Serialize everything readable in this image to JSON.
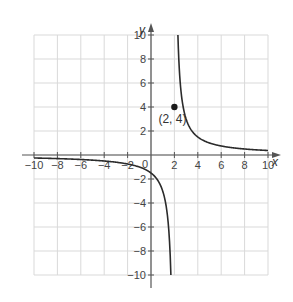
{
  "chart_data": {
    "type": "line",
    "title": "",
    "xlabel": "x",
    "ylabel": "y",
    "xlim": [
      -10,
      10
    ],
    "ylim": [
      -10,
      10
    ],
    "grid": true,
    "x_ticks": [
      -10,
      -8,
      -6,
      -4,
      -2,
      2,
      4,
      6,
      8,
      10
    ],
    "y_ticks": [
      -10,
      -8,
      -6,
      -4,
      -2,
      2,
      4,
      6,
      8,
      10
    ],
    "origin_label": "0",
    "function": "f(x) = 3/(x - 2)",
    "vertical_asymptote": 2,
    "horizontal_asymptote": 0,
    "series": [
      {
        "name": "left-branch",
        "x": [
          -10,
          -8,
          -6,
          -4,
          -2,
          -1,
          0,
          0.5,
          1,
          1.3,
          1.5,
          1.6,
          1.7
        ],
        "y": [
          -0.25,
          -0.3,
          -0.375,
          -0.5,
          -0.75,
          -1,
          -1.5,
          -2,
          -3,
          -4.29,
          -6,
          -7.5,
          -10
        ]
      },
      {
        "name": "right-branch",
        "x": [
          2.3,
          2.4,
          2.5,
          2.75,
          3,
          3.5,
          4,
          5,
          6,
          8,
          10
        ],
        "y": [
          10,
          7.5,
          6,
          4,
          3,
          2,
          1.5,
          1,
          0.75,
          0.5,
          0.375
        ]
      }
    ],
    "annotations": [
      {
        "type": "point",
        "x": 2,
        "y": 4,
        "label": "(2, 4)"
      }
    ]
  },
  "labels": {
    "x_axis": "x",
    "y_axis": "y",
    "origin": "0",
    "point": "(2, 4)",
    "xticks": [
      "−10",
      "−8",
      "−6",
      "−4",
      "−2",
      "2",
      "4",
      "6",
      "8",
      "10"
    ],
    "yticks": [
      "10",
      "8",
      "6",
      "4",
      "2",
      "−2",
      "−4",
      "−6",
      "−8",
      "−10"
    ]
  },
  "colors": {
    "curve": "#2b2b2b",
    "grid": "#d9d9d9",
    "axis": "#555555",
    "text": "#444444"
  }
}
